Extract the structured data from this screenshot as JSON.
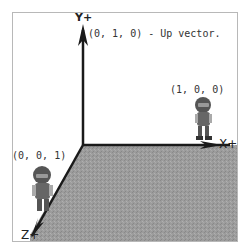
{
  "diagram": {
    "axes": {
      "y": {
        "label": "Y+"
      },
      "x": {
        "label": "X+"
      },
      "z": {
        "label": "Z+"
      }
    },
    "annotations": {
      "up_vector": "(0, 1, 0) - Up vector.",
      "x_point": "(1, 0, 0)",
      "z_point": "(0, 0, 1)"
    },
    "colors": {
      "floor": "#9a9a9a",
      "axis": "#1a1a1a",
      "border": "#b8b8b8"
    }
  }
}
